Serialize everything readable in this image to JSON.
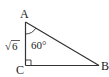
{
  "diagram": {
    "type": "right-triangle",
    "vertices": {
      "A": "A",
      "B": "B",
      "C": "C"
    },
    "right_angle_at": "C",
    "angle_A": "60°",
    "side_AC": {
      "radical": "√",
      "radicand": "6"
    },
    "colors": {
      "stroke": "#333333",
      "text": "#222222"
    }
  }
}
